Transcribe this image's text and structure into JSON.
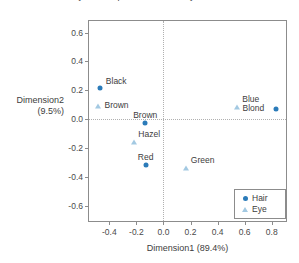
{
  "chart_data": {
    "type": "scatter",
    "title": "Symmetric plot for Hair and Eye colour",
    "xlabel": "Dimension1 (89.4%)",
    "ylabel_line1": "Dimension2",
    "ylabel_line2": "(9.5%)",
    "xlim": [
      -0.55,
      0.92
    ],
    "ylim": [
      -0.72,
      0.68
    ],
    "xticks": [
      "-0.4",
      "-0.2",
      "0.0",
      "0.2",
      "0.4",
      "0.6",
      "0.8"
    ],
    "xtick_values": [
      -0.4,
      -0.2,
      0.0,
      0.2,
      0.4,
      0.6,
      0.8
    ],
    "yticks": [
      "0.6",
      "0.4",
      "0.2",
      "0.0",
      "-0.2",
      "-0.4",
      "-0.6"
    ],
    "ytick_values": [
      0.6,
      0.4,
      0.2,
      0.0,
      -0.2,
      -0.4,
      -0.6
    ],
    "grid": false,
    "reference_lines": {
      "vertical_x": 0.0,
      "horizontal_y": 0.0
    },
    "legend_position": "bottom-right",
    "colors": {
      "hair": "#2b7bb9",
      "eye": "#a3c9e2",
      "frame": "#8c8c8c",
      "text": "#3d3d3d"
    },
    "series": [
      {
        "name": "Hair",
        "marker": "circle",
        "color": "#2b7bb9",
        "points": [
          {
            "label": "Black",
            "x": -0.47,
            "y": 0.215,
            "label_dx": 6,
            "label_dy": -11
          },
          {
            "label": "Brown",
            "x": -0.135,
            "y": -0.03,
            "label_dx": -12,
            "label_dy": -12
          },
          {
            "label": "Red",
            "x": -0.13,
            "y": -0.32,
            "label_dx": -8,
            "label_dy": -12
          },
          {
            "label": "Blond",
            "x": 0.835,
            "y": 0.07,
            "label_dx": -34,
            "label_dy": -5
          }
        ]
      },
      {
        "name": "Eye",
        "marker": "triangle",
        "color": "#a3c9e2",
        "points": [
          {
            "label": "Brown",
            "x": -0.48,
            "y": 0.09,
            "label_dx": 6,
            "label_dy": -5
          },
          {
            "label": "Hazel",
            "x": -0.215,
            "y": -0.16,
            "label_dx": 4,
            "label_dy": -12
          },
          {
            "label": "Green",
            "x": 0.165,
            "y": -0.34,
            "label_dx": 5,
            "label_dy": -12
          },
          {
            "label": "Blue",
            "x": 0.545,
            "y": 0.085,
            "label_dx": 5,
            "label_dy": -12
          }
        ]
      }
    ]
  },
  "legend": {
    "items": [
      {
        "label": "Hair",
        "marker": "circle",
        "color": "#2b7bb9"
      },
      {
        "label": "Eye",
        "marker": "triangle",
        "color": "#a3c9e2"
      }
    ]
  }
}
